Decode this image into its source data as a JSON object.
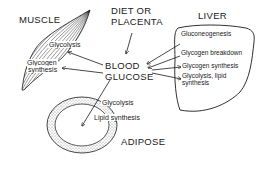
{
  "diagram": {
    "organs": {
      "muscle": {
        "label": "MUSCLE",
        "processes": [
          "Glycolysis",
          "Glycogen",
          "synthesis"
        ]
      },
      "liver": {
        "label": "LIVER",
        "processes": [
          "Gluconeogenesis",
          "Glycogen breakdown",
          "Glycogen synthesis",
          "Glycolysis, lipid",
          "synthesis"
        ]
      },
      "adipose": {
        "label": "ADIPOSE",
        "processes": [
          "Glycolysis",
          "Lipid synthesis"
        ]
      }
    },
    "source": {
      "line1": "DIET OR",
      "line2": "PLACENTA"
    },
    "center": {
      "line1": "BLOOD",
      "line2": "GLUCOSE"
    },
    "colors": {
      "ink": "#1a1a1a",
      "background": "#ffffff",
      "stipple": "#bdbdbd"
    }
  }
}
